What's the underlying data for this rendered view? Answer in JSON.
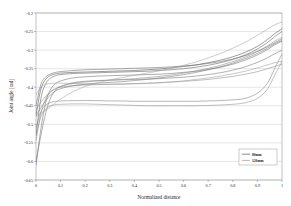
{
  "chart_data": {
    "type": "line",
    "title": "",
    "xlabel": "Normalized distance",
    "ylabel": "Joint angle [rad]",
    "xlim": [
      0,
      1
    ],
    "ylim": [
      -0.65,
      -0.2
    ],
    "grid": "horizontal",
    "legend_position": "bottom-right",
    "xticks": [
      "0",
      "0.1",
      "0.2",
      "0.3",
      "0.4",
      "0.5",
      "0.6",
      "0.7",
      "0.8",
      "0.9",
      "1"
    ],
    "xtick_values": [
      0,
      0.1,
      0.2,
      0.3,
      0.4,
      0.5,
      0.6,
      0.7,
      0.8,
      0.9,
      1
    ],
    "yticks": [
      "-0.2",
      "-0.25",
      "-0.3",
      "-0.35",
      "-0.4",
      "-0.45",
      "-0.5",
      "-0.55",
      "-0.6",
      "-0.65"
    ],
    "ytick_values": [
      -0.2,
      -0.25,
      -0.3,
      -0.35,
      -0.4,
      -0.45,
      -0.5,
      -0.55,
      -0.6,
      -0.65
    ],
    "legend": [
      {
        "name": "80mm",
        "color": "#555555"
      },
      {
        "name": "120mm",
        "color": "#999999"
      }
    ],
    "x": [
      0,
      0.02,
      0.04,
      0.06,
      0.08,
      0.1,
      0.15,
      0.2,
      0.25,
      0.3,
      0.35,
      0.4,
      0.45,
      0.5,
      0.55,
      0.6,
      0.65,
      0.7,
      0.75,
      0.8,
      0.85,
      0.9,
      0.94,
      0.97,
      1
    ],
    "series": [
      {
        "name": "80mm-1",
        "color": "#4a4a4a",
        "values": [
          -0.475,
          -0.405,
          -0.378,
          -0.368,
          -0.364,
          -0.362,
          -0.36,
          -0.359,
          -0.358,
          -0.357,
          -0.356,
          -0.355,
          -0.353,
          -0.351,
          -0.348,
          -0.344,
          -0.34,
          -0.334,
          -0.327,
          -0.318,
          -0.306,
          -0.29,
          -0.272,
          -0.256,
          -0.242
        ]
      },
      {
        "name": "80mm-2",
        "color": "#5a5a5a",
        "values": [
          -0.53,
          -0.43,
          -0.39,
          -0.375,
          -0.369,
          -0.366,
          -0.363,
          -0.362,
          -0.361,
          -0.36,
          -0.359,
          -0.358,
          -0.357,
          -0.355,
          -0.353,
          -0.35,
          -0.346,
          -0.341,
          -0.334,
          -0.325,
          -0.313,
          -0.297,
          -0.28,
          -0.264,
          -0.25
        ]
      },
      {
        "name": "80mm-3",
        "color": "#6a6a6a",
        "values": [
          -0.61,
          -0.512,
          -0.44,
          -0.405,
          -0.39,
          -0.383,
          -0.375,
          -0.372,
          -0.37,
          -0.369,
          -0.368,
          -0.367,
          -0.366,
          -0.365,
          -0.363,
          -0.36,
          -0.357,
          -0.352,
          -0.346,
          -0.338,
          -0.327,
          -0.313,
          -0.299,
          -0.286,
          -0.276
        ]
      },
      {
        "name": "80mm-4",
        "color": "#707070",
        "values": [
          -0.6,
          -0.53,
          -0.468,
          -0.428,
          -0.408,
          -0.398,
          -0.388,
          -0.384,
          -0.382,
          -0.381,
          -0.38,
          -0.379,
          -0.378,
          -0.377,
          -0.375,
          -0.373,
          -0.37,
          -0.366,
          -0.361,
          -0.354,
          -0.345,
          -0.333,
          -0.321,
          -0.31,
          -0.3
        ]
      },
      {
        "name": "80mm-5",
        "color": "#656565",
        "values": [
          -0.45,
          -0.392,
          -0.372,
          -0.364,
          -0.36,
          -0.358,
          -0.355,
          -0.353,
          -0.352,
          -0.351,
          -0.35,
          -0.349,
          -0.348,
          -0.347,
          -0.345,
          -0.343,
          -0.34,
          -0.336,
          -0.331,
          -0.324,
          -0.315,
          -0.303,
          -0.291,
          -0.28,
          -0.27
        ]
      },
      {
        "name": "120mm-1",
        "color": "#8a8a8a",
        "values": [
          -0.545,
          -0.47,
          -0.43,
          -0.412,
          -0.404,
          -0.4,
          -0.396,
          -0.394,
          -0.393,
          -0.392,
          -0.391,
          -0.39,
          -0.389,
          -0.388,
          -0.386,
          -0.384,
          -0.382,
          -0.379,
          -0.375,
          -0.371,
          -0.365,
          -0.358,
          -0.35,
          -0.344,
          -0.338
        ]
      },
      {
        "name": "120mm-2",
        "color": "#7d7d7d",
        "values": [
          -0.51,
          -0.466,
          -0.448,
          -0.441,
          -0.438,
          -0.437,
          -0.436,
          -0.436,
          -0.436,
          -0.437,
          -0.437,
          -0.438,
          -0.438,
          -0.438,
          -0.438,
          -0.438,
          -0.438,
          -0.437,
          -0.436,
          -0.434,
          -0.43,
          -0.416,
          -0.39,
          -0.35,
          -0.31
        ]
      },
      {
        "name": "120mm-3",
        "color": "#8e8e8e",
        "values": [
          -0.53,
          -0.48,
          -0.458,
          -0.45,
          -0.447,
          -0.446,
          -0.445,
          -0.445,
          -0.446,
          -0.447,
          -0.448,
          -0.449,
          -0.45,
          -0.45,
          -0.45,
          -0.45,
          -0.45,
          -0.449,
          -0.448,
          -0.446,
          -0.442,
          -0.43,
          -0.406,
          -0.368,
          -0.33
        ]
      },
      {
        "name": "120mm-4",
        "color": "#9a9a9a",
        "values": [
          -0.42,
          -0.4,
          -0.392,
          -0.39,
          -0.389,
          -0.389,
          -0.39,
          -0.391,
          -0.392,
          -0.392,
          -0.392,
          -0.391,
          -0.39,
          -0.388,
          -0.386,
          -0.383,
          -0.379,
          -0.375,
          -0.37,
          -0.364,
          -0.357,
          -0.348,
          -0.34,
          -0.334,
          -0.33
        ]
      },
      {
        "name": "120mm-5",
        "color": "#888888",
        "values": [
          -0.462,
          -0.44,
          -0.425,
          -0.412,
          -0.404,
          -0.398,
          -0.39,
          -0.386,
          -0.383,
          -0.381,
          -0.379,
          -0.377,
          -0.374,
          -0.371,
          -0.367,
          -0.362,
          -0.356,
          -0.349,
          -0.341,
          -0.331,
          -0.319,
          -0.304,
          -0.289,
          -0.276,
          -0.266
        ]
      },
      {
        "name": "120mm-6",
        "color": "#6e6e6e",
        "values": [
          -0.478,
          -0.455,
          -0.436,
          -0.42,
          -0.41,
          -0.404,
          -0.396,
          -0.392,
          -0.389,
          -0.387,
          -0.385,
          -0.382,
          -0.379,
          -0.375,
          -0.371,
          -0.366,
          -0.36,
          -0.353,
          -0.345,
          -0.335,
          -0.323,
          -0.309,
          -0.295,
          -0.283,
          -0.274
        ]
      },
      {
        "name": "120mm-7",
        "color": "#a0a0a0",
        "values": [
          -0.48,
          -0.47,
          -0.462,
          -0.452,
          -0.442,
          -0.432,
          -0.412,
          -0.398,
          -0.388,
          -0.38,
          -0.374,
          -0.368,
          -0.362,
          -0.356,
          -0.349,
          -0.341,
          -0.332,
          -0.321,
          -0.309,
          -0.295,
          -0.279,
          -0.26,
          -0.244,
          -0.232,
          -0.224
        ]
      }
    ]
  },
  "axes": {
    "x_title": "Normalized distance",
    "y_title": "Joint angle [rad]"
  },
  "colors": {
    "frame": "#999999",
    "grid": "#cccccc",
    "background": "#ffffff"
  }
}
